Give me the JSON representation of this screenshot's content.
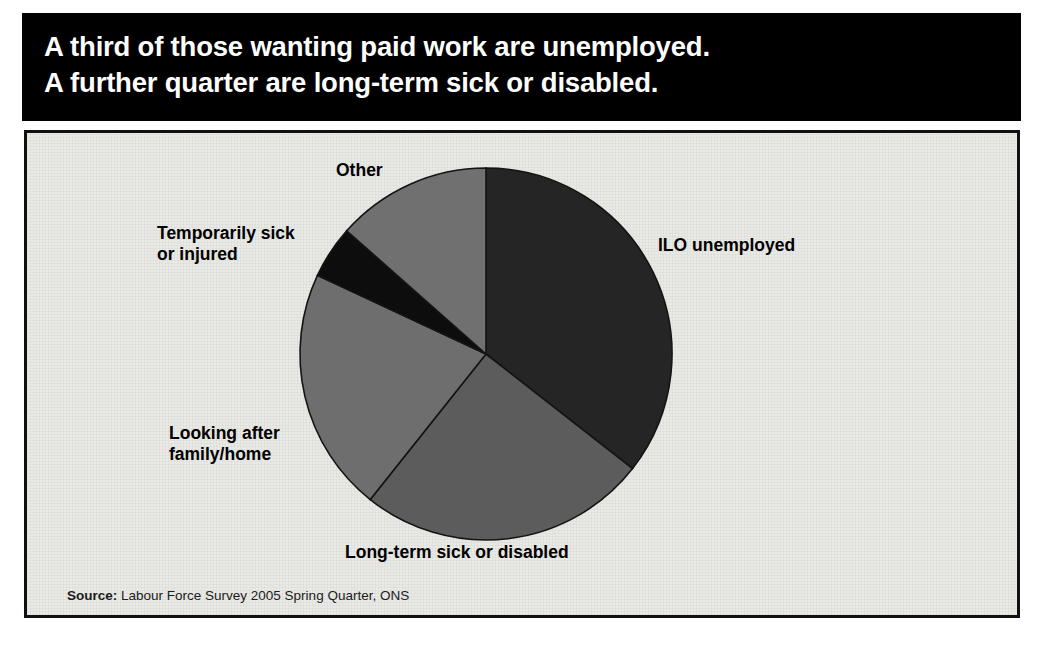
{
  "title": {
    "line1": "A third of those wanting paid work are unemployed.",
    "line2": "A further quarter are long-term sick or disabled.",
    "background_color": "#000000",
    "text_color": "#ffffff"
  },
  "source": {
    "label": "Source:",
    "text": " Labour Force Survey 2005 Spring Quarter, ONS"
  },
  "panel": {
    "background_color": "#e9e9e6",
    "border_color": "#111111"
  },
  "labels": {
    "other": "Other",
    "temporarily_sick": "Temporarily sick\nor injured",
    "looking_after": "Looking after\nfamily/home",
    "long_term_sick": "Long-term sick or disabled",
    "ilo_unemployed": "ILO unemployed"
  },
  "chart_data": {
    "type": "pie",
    "title": "A third of those wanting paid work are unemployed. A further quarter are long-term sick or disabled.",
    "xlabel": "",
    "ylabel": "",
    "legend_position": "none-labels-outside",
    "grid": false,
    "start_angle_deg": 0,
    "direction": "clockwise",
    "categories": [
      "ILO unemployed",
      "Long-term sick or disabled",
      "Looking after family/home",
      "Temporarily sick or injured",
      "Other"
    ],
    "values": [
      35.6,
      25.1,
      21.3,
      4.6,
      13.4
    ],
    "units": "percent",
    "slices": [
      {
        "label": "ILO unemployed",
        "value": 35.6,
        "start_deg": 0.0,
        "end_deg": 128.0,
        "color": "#252525"
      },
      {
        "label": "Long-term sick or disabled",
        "value": 25.1,
        "start_deg": 128.0,
        "end_deg": 218.5,
        "color": "#5c5c5c"
      },
      {
        "label": "Looking after family/home",
        "value": 21.3,
        "start_deg": 218.5,
        "end_deg": 295.0,
        "color": "#6e6e6e"
      },
      {
        "label": "Temporarily sick or injured",
        "value": 4.6,
        "start_deg": 295.0,
        "end_deg": 311.5,
        "color": "#0d0d0d"
      },
      {
        "label": "Other",
        "value": 13.4,
        "start_deg": 311.5,
        "end_deg": 360.0,
        "color": "#707070"
      }
    ],
    "geometry": {
      "cx": 459,
      "cy": 221,
      "r": 186
    }
  }
}
